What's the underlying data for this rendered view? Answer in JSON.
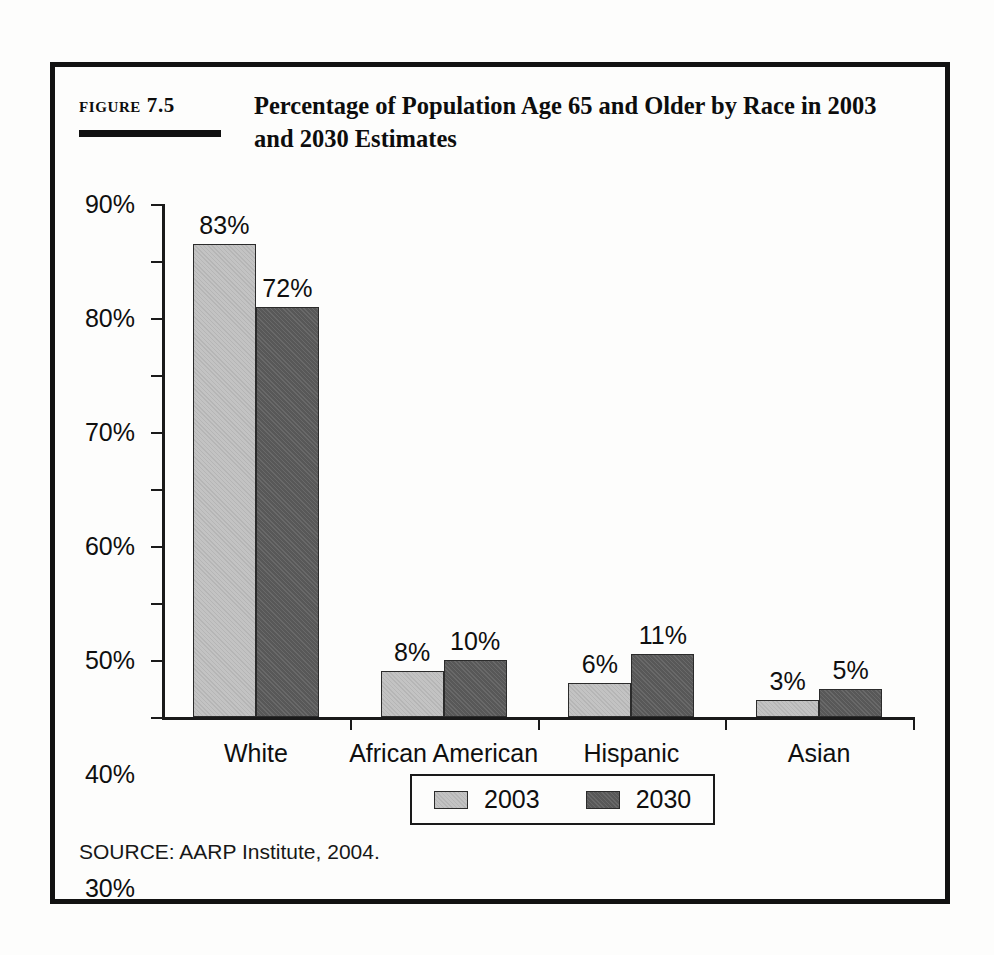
{
  "figure": {
    "number_label": "Figure 7.5",
    "title": "Percentage of Population Age 65 and Older by Race in 2003 and 2030 Estimates",
    "source": "SOURCE: AARP Institute, 2004."
  },
  "colors": {
    "series_2003": "#c3c3c3",
    "series_2030": "#585858",
    "frame": "#121212",
    "axis": "#1a1a1a",
    "text": "#0f0f0f",
    "background": "#fdfdfc"
  },
  "chart_data": {
    "type": "bar",
    "title": "Percentage of Population Age 65 and Older by Race in 2003 and 2030 Estimates",
    "xlabel": "",
    "ylabel": "",
    "categories": [
      "White",
      "African American",
      "Hispanic",
      "Asian"
    ],
    "series": [
      {
        "name": "2003",
        "color": "#c3c3c3",
        "values": [
          83,
          72,
          0,
          0
        ]
      },
      {
        "name": "2030",
        "color": "#585858",
        "values": [
          0,
          0,
          0,
          0
        ]
      }
    ],
    "series_correct": [
      {
        "name": "2003",
        "color": "#c3c3c3",
        "values": [
          83,
          8,
          6,
          3
        ]
      },
      {
        "name": "2030",
        "color": "#585858",
        "values": [
          72,
          10,
          11,
          5
        ]
      }
    ],
    "value_labels": [
      [
        "83%",
        "8%",
        "6%",
        "3%"
      ],
      [
        "72%",
        "10%",
        "11%",
        "5%"
      ]
    ],
    "ylim": [
      0,
      90
    ],
    "yticks": [
      0,
      10,
      20,
      30,
      40,
      50,
      60,
      70,
      80,
      90
    ],
    "ytick_labels": [
      "0%",
      "10%",
      "20%",
      "30%",
      "40%",
      "50%",
      "60%",
      "70%",
      "80%",
      "90%"
    ],
    "grid": false,
    "legend_position": "bottom",
    "legend_entries": [
      "2003",
      "2030"
    ]
  }
}
